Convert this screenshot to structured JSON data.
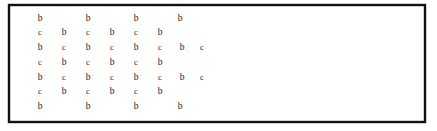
{
  "figure": {
    "name": "lattice-crosshatch-rectangle",
    "width": 437,
    "height": 131,
    "background_color": "#ffffff"
  },
  "frame": {
    "name": "outer-rectangle",
    "x": 9,
    "y": 5,
    "width": 416,
    "height": 117,
    "stroke_color": "#111111",
    "stroke_width": 2.4,
    "fill_color": "#ffffff"
  },
  "lattice": {
    "stroke_color": "#3a3a3a",
    "stroke_width": 1.15,
    "spacing": 29,
    "descending": [
      {
        "x1": 9,
        "y1": 34,
        "x2": 38,
        "y2": 5
      },
      {
        "x1": 9,
        "y1": 63,
        "x2": 67,
        "y2": 5
      },
      {
        "x1": 9,
        "y1": 92,
        "x2": 96,
        "y2": 5
      },
      {
        "x1": 9,
        "y1": 121,
        "x2": 125,
        "y2": 5
      },
      {
        "x1": 38,
        "y1": 122,
        "x2": 154,
        "y2": 5
      },
      {
        "x1": 67,
        "y1": 122,
        "x2": 183,
        "y2": 5
      },
      {
        "x1": 96,
        "y1": 122,
        "x2": 212,
        "y2": 5
      },
      {
        "x1": 125,
        "y1": 122,
        "x2": 241,
        "y2": 5
      },
      {
        "x1": 154,
        "y1": 122,
        "x2": 270,
        "y2": 5
      },
      {
        "x1": 212,
        "y1": 122,
        "x2": 290,
        "y2": 5
      }
    ],
    "ascending": [
      {
        "x1": 9,
        "y1": 34,
        "x2": 38,
        "y2": 63
      },
      {
        "x1": 9,
        "y1": 63,
        "x2": 67,
        "y2": 122
      },
      {
        "x1": 9,
        "y1": 92,
        "x2": 38,
        "y2": 122
      },
      {
        "x1": 9,
        "y1": 5,
        "x2": 125,
        "y2": 122
      },
      {
        "x1": 38,
        "y1": 5,
        "x2": 154,
        "y2": 122
      },
      {
        "x1": 67,
        "y1": 5,
        "x2": 183,
        "y2": 122
      },
      {
        "x1": 96,
        "y1": 5,
        "x2": 212,
        "y2": 122
      },
      {
        "x1": 125,
        "y1": 5,
        "x2": 241,
        "y2": 122
      },
      {
        "x1": 154,
        "y1": 5,
        "x2": 270,
        "y2": 122
      },
      {
        "x1": 183,
        "y1": 5,
        "x2": 299,
        "y2": 122
      },
      {
        "x1": 212,
        "y1": 5,
        "x2": 328,
        "y2": 122
      }
    ]
  },
  "labels": {
    "cell_letter": "b",
    "vertex_letter": "c",
    "rows": [
      {
        "row_index": 0,
        "y": 19,
        "letter": "b",
        "class": "cell-label",
        "xs": [
          40,
          88,
          136,
          180
        ]
      },
      {
        "row_index": 1,
        "y": 33,
        "letter": "c",
        "class": "vertex-label",
        "xs": [
          40,
          88,
          136
        ]
      },
      {
        "row_index": 1,
        "y": 33,
        "letter": "b",
        "class": "cell-label",
        "xs": [
          64,
          112,
          160
        ]
      },
      {
        "row_index": 2,
        "y": 48,
        "letter": "b",
        "class": "cell-label",
        "xs": [
          40,
          88,
          136,
          182
        ]
      },
      {
        "row_index": 2,
        "y": 48,
        "letter": "c",
        "class": "vertex-label",
        "xs": [
          64,
          112,
          160,
          202
        ]
      },
      {
        "row_index": 3,
        "y": 63,
        "letter": "c",
        "class": "vertex-label",
        "xs": [
          40,
          88,
          136
        ]
      },
      {
        "row_index": 3,
        "y": 63,
        "letter": "b",
        "class": "cell-label",
        "xs": [
          64,
          112,
          160
        ]
      },
      {
        "row_index": 4,
        "y": 78,
        "letter": "b",
        "class": "cell-label",
        "xs": [
          40,
          88,
          136,
          182
        ]
      },
      {
        "row_index": 4,
        "y": 78,
        "letter": "c",
        "class": "vertex-label",
        "xs": [
          64,
          112,
          160,
          202
        ]
      },
      {
        "row_index": 5,
        "y": 92,
        "letter": "c",
        "class": "vertex-label",
        "xs": [
          40,
          88,
          136
        ]
      },
      {
        "row_index": 5,
        "y": 92,
        "letter": "b",
        "class": "cell-label",
        "xs": [
          64,
          112,
          160
        ]
      },
      {
        "row_index": 6,
        "y": 107,
        "letter": "b",
        "class": "cell-label",
        "xs": [
          40,
          88,
          136,
          180
        ]
      }
    ]
  }
}
